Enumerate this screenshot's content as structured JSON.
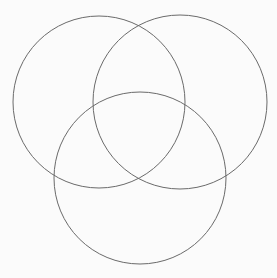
{
  "diagram": {
    "type": "venn",
    "background": "#fbfbfb",
    "stroke_color": "#6a6a6a",
    "stroke_width": 1,
    "circles": [
      {
        "name": "top-left",
        "cx": 99,
        "cy": 102,
        "r": 86
      },
      {
        "name": "top-right",
        "cx": 180,
        "cy": 102,
        "r": 87
      },
      {
        "name": "bottom",
        "cx": 140,
        "cy": 178,
        "r": 86
      }
    ]
  }
}
